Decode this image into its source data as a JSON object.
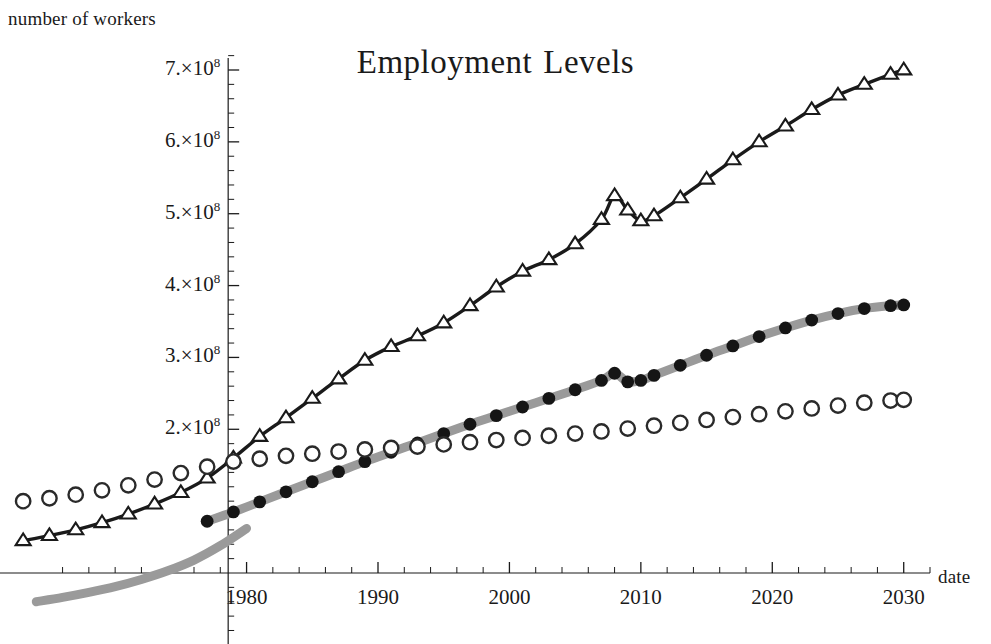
{
  "chart_data": {
    "type": "line",
    "xlabel": "date",
    "ylabel": "number of workers",
    "grid": false,
    "legend": "none",
    "xlim": [
      1962,
      2032
    ],
    "ylim": [
      0,
      760000000
    ],
    "xticks": [
      1980,
      1990,
      2000,
      2010,
      2020,
      2030
    ],
    "xtick_labels": [
      "1980",
      "1990",
      "2000",
      "2010",
      "2020",
      "2030"
    ],
    "xminor_step": 2,
    "yticks": [
      200000000,
      300000000,
      400000000,
      500000000,
      600000000,
      700000000
    ],
    "ytick_labels": [
      "2.×10",
      "3.×10",
      "4.×10",
      "5.×10",
      "6.×10",
      "7.×10"
    ],
    "ytick_exponent": "8",
    "series": [
      {
        "name": "total employment",
        "marker": "open-triangle",
        "line": "solid-black",
        "color": "#1a1a1a",
        "x": [
          1963,
          1965,
          1967,
          1969,
          1971,
          1973,
          1975,
          1977,
          1979,
          1981,
          1983,
          1985,
          1987,
          1989,
          1991,
          1993,
          1995,
          1997,
          1999,
          2001,
          2003,
          2005,
          2007,
          2008,
          2009,
          2010,
          2011,
          2013,
          2015,
          2017,
          2019,
          2021,
          2023,
          2025,
          2027,
          2029,
          2030
        ],
        "values": [
          45000000,
          52000000,
          60000000,
          70000000,
          82000000,
          96000000,
          112000000,
          132000000,
          160000000,
          190000000,
          216000000,
          243000000,
          270000000,
          296000000,
          315000000,
          330000000,
          348000000,
          372000000,
          398000000,
          420000000,
          436000000,
          458000000,
          492000000,
          525000000,
          505000000,
          490000000,
          497000000,
          522000000,
          548000000,
          575000000,
          600000000,
          622000000,
          645000000,
          665000000,
          680000000,
          694000000,
          700000000
        ]
      },
      {
        "name": "projected employment",
        "marker": "filled-circle",
        "line": "thick-gray",
        "color": "#151515",
        "line_color": "#9a9a9a",
        "x": [
          1977,
          1979,
          1981,
          1983,
          1985,
          1987,
          1989,
          1991,
          1993,
          1995,
          1997,
          1999,
          2001,
          2003,
          2005,
          2007,
          2008,
          2009,
          2010,
          2011,
          2013,
          2015,
          2017,
          2019,
          2021,
          2023,
          2025,
          2027,
          2029,
          2030
        ],
        "values": [
          72000000,
          85000000,
          99000000,
          113000000,
          127000000,
          141000000,
          155000000,
          168000000,
          181000000,
          194000000,
          207000000,
          219000000,
          231000000,
          243000000,
          255000000,
          268000000,
          278000000,
          266000000,
          268000000,
          275000000,
          289000000,
          303000000,
          316000000,
          329000000,
          341000000,
          352000000,
          361000000,
          368000000,
          372000000,
          373000000
        ]
      },
      {
        "name": "baseline employment",
        "marker": "open-circle",
        "line": "none",
        "color": "#2a2a2a",
        "x": [
          1963,
          1965,
          1967,
          1969,
          1971,
          1973,
          1975,
          1977,
          1979,
          1981,
          1983,
          1985,
          1987,
          1989,
          1991,
          1993,
          1995,
          1997,
          1999,
          2001,
          2003,
          2005,
          2007,
          2009,
          2011,
          2013,
          2015,
          2017,
          2019,
          2021,
          2023,
          2025,
          2027,
          2029,
          2030
        ],
        "values": [
          100000000,
          104000000,
          109000000,
          115000000,
          122000000,
          130000000,
          139000000,
          148000000,
          155000000,
          159000000,
          163000000,
          166000000,
          169000000,
          172000000,
          174000000,
          176000000,
          179000000,
          182000000,
          185000000,
          188000000,
          191000000,
          194000000,
          197000000,
          201000000,
          205000000,
          209000000,
          213000000,
          217000000,
          221000000,
          225000000,
          229000000,
          233000000,
          237000000,
          240000000,
          241000000
        ]
      }
    ],
    "gray_baseline_curve": {
      "name": "gray-projection-tail",
      "color": "#9a9a9a",
      "x": [
        1964,
        1966,
        1968,
        1970,
        1972,
        1974,
        1976,
        1978,
        1980
      ],
      "values": [
        -40000000,
        -34000000,
        -27000000,
        -19000000,
        -9000000,
        3000000,
        18000000,
        38000000,
        62000000
      ]
    }
  }
}
